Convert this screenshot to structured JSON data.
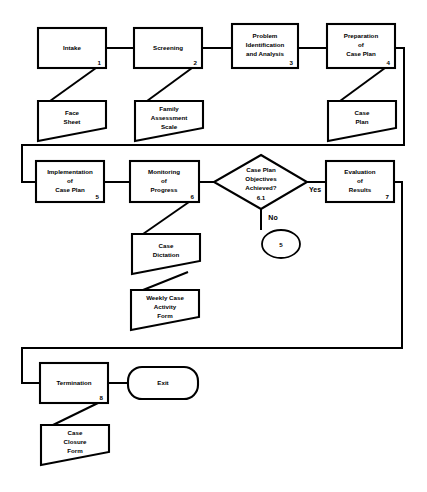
{
  "diagram": {
    "colors": {
      "background": "#ffffff",
      "stroke": "#000000",
      "fill": "#ffffff"
    },
    "process_nodes": [
      {
        "id": "intake",
        "label_lines": [
          "Intake"
        ],
        "number": "1"
      },
      {
        "id": "screening",
        "label_lines": [
          "Screening"
        ],
        "number": "2"
      },
      {
        "id": "problem_id",
        "label_lines": [
          "Problem",
          "Identification",
          "and Analysis"
        ],
        "number": "3"
      },
      {
        "id": "prep_case_plan",
        "label_lines": [
          "Preparation",
          "of",
          "Case Plan"
        ],
        "number": "4"
      },
      {
        "id": "implementation",
        "label_lines": [
          "Implementation",
          "of",
          "Case Plan"
        ],
        "number": "5"
      },
      {
        "id": "monitoring",
        "label_lines": [
          "Monitoring",
          "of",
          "Progress"
        ],
        "number": "6"
      },
      {
        "id": "evaluation",
        "label_lines": [
          "Evaluation",
          "of",
          "Results"
        ],
        "number": "7"
      },
      {
        "id": "termination",
        "label_lines": [
          "Termination"
        ],
        "number": "8"
      }
    ],
    "decision_nodes": [
      {
        "id": "objectives_achieved",
        "label_lines": [
          "Case Plan",
          "Objectives",
          "Achieved?"
        ],
        "number": "6.1"
      }
    ],
    "document_nodes": [
      {
        "id": "face_sheet",
        "label_lines": [
          "Face",
          "Sheet"
        ]
      },
      {
        "id": "family_assess",
        "label_lines": [
          "Family",
          "Assessment",
          "Scale"
        ]
      },
      {
        "id": "case_plan_doc",
        "label_lines": [
          "Case",
          "Plan"
        ]
      },
      {
        "id": "case_dictation",
        "label_lines": [
          "Case",
          "Dictation"
        ]
      },
      {
        "id": "weekly_form",
        "label_lines": [
          "Weekly Case",
          "Activity",
          "Form"
        ]
      },
      {
        "id": "case_closure",
        "label_lines": [
          "Case",
          "Closure",
          "Form"
        ]
      }
    ],
    "terminal_nodes": [
      {
        "id": "exit",
        "label_lines": [
          "Exit"
        ]
      }
    ],
    "connector_nodes": [
      {
        "id": "offpage_5",
        "label": "5"
      }
    ],
    "edge_labels": [
      {
        "id": "yes_label",
        "label": "Yes"
      },
      {
        "id": "no_label",
        "label": "No"
      }
    ]
  }
}
